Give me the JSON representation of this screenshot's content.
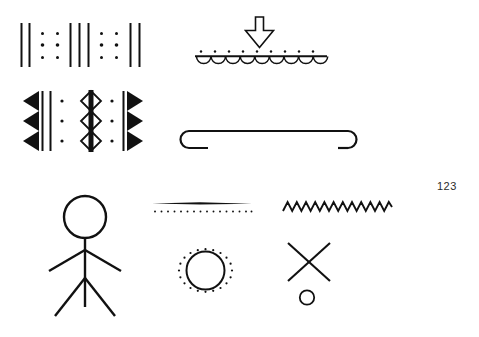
{
  "page": {
    "number": "123",
    "background_color": "#ffffff",
    "ink_color": "#111111",
    "width": 479,
    "height": 337
  },
  "figure": {
    "title": "",
    "caption": "",
    "kind": "line-drawing plate of abstract graphic signs",
    "symbols": [
      {
        "id": "sym-striped-dotted-band",
        "name": "striped-dotted-band",
        "description": "Horizontal band of vertical strokes alternating with columns of dots",
        "position": {
          "x": 18,
          "y": 22,
          "w": 126,
          "h": 46
        },
        "elements": {
          "line_groups": [
            2,
            3,
            2
          ],
          "dot_columns": 4,
          "dot_rows": 3
        }
      },
      {
        "id": "sym-arrow-over-scalloped-line",
        "name": "arrow-over-scalloped-line",
        "description": "Outlined downward arrow above a horizontal line with dots above and semicircular scallops below",
        "position": {
          "x": 195,
          "y": 16,
          "w": 135,
          "h": 50
        },
        "elements": {
          "arrow_direction": "down",
          "arrow_fill": "outline",
          "dots_above": 9,
          "scallops_below": 9
        }
      },
      {
        "id": "sym-chevron-diamond-band",
        "name": "chevron-diamond-band",
        "description": "Mirrored solid chevron columns flanking vertical rules, dot columns and a central stack of outlined diamonds on a thick bar",
        "position": {
          "x": 20,
          "y": 90,
          "w": 122,
          "h": 62
        },
        "elements": {
          "chevron_count_each_side": 3,
          "diamond_count": 3,
          "dot_columns": 2,
          "dot_rows": 3
        }
      },
      {
        "id": "sym-double-hook-bar",
        "name": "double-hook-bar",
        "description": "Long horizontal bar terminating in opposed hooks, left hook opening right, right hook opening left",
        "position": {
          "x": 180,
          "y": 115,
          "w": 183,
          "h": 35
        },
        "elements": {
          "left_hook": "open-right",
          "right_hook": "open-left"
        }
      },
      {
        "id": "sym-stick-figure",
        "name": "stick-figure",
        "description": "Human stick figure with circular head, two outstretched arms and two spread legs with a central stroke",
        "position": {
          "x": 45,
          "y": 196,
          "w": 95,
          "h": 120
        },
        "elements": {
          "head": "circle",
          "arms": 2,
          "legs": 2,
          "center_stroke": 1
        }
      },
      {
        "id": "sym-line-over-dotted-line",
        "name": "line-over-dotted-line",
        "description": "Solid horizontal stroke above a parallel row of dots",
        "position": {
          "x": 152,
          "y": 198,
          "w": 100,
          "h": 16
        },
        "elements": {
          "solid_lines": 1,
          "dots": 28
        }
      },
      {
        "id": "sym-zigzag",
        "name": "zigzag-line",
        "description": "Horizontal zigzag / sawtooth line",
        "position": {
          "x": 283,
          "y": 198,
          "w": 110,
          "h": 18
        },
        "elements": {
          "peaks": 12
        }
      },
      {
        "id": "sym-circle-in-dot-ring",
        "name": "circle-in-dot-ring",
        "description": "Open circle surrounded by a ring of small dots",
        "position": {
          "x": 178,
          "y": 243,
          "w": 55,
          "h": 55
        },
        "elements": {
          "inner_circle_radius": 19,
          "ring_dots": 26
        }
      },
      {
        "id": "sym-cross-with-circle",
        "name": "cross-with-circle",
        "description": "Diagonal cross (X) with a small open circle beneath",
        "position": {
          "x": 285,
          "y": 242,
          "w": 58,
          "h": 68
        },
        "elements": {
          "strokes": 2,
          "circle_radius": 7
        }
      }
    ]
  }
}
